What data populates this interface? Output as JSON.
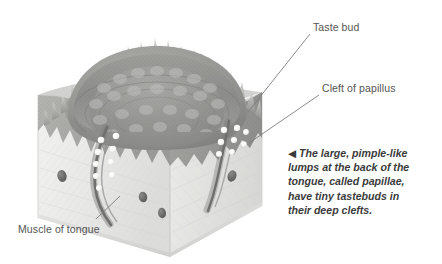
{
  "figure": {
    "background_color": "#ffffff"
  },
  "labels": [
    {
      "id": "taste-bud",
      "text": "Taste bud",
      "x": 313,
      "y": 21
    },
    {
      "id": "cleft",
      "text": "Cleft of papillus",
      "x": 322,
      "y": 82
    },
    {
      "id": "muscle",
      "text": "Muscle of tongue",
      "x": 18,
      "y": 223
    }
  ],
  "caption": {
    "arrow": "◀",
    "lines": [
      "The large, pimple-like",
      "lumps at the back of the",
      "tongue, called papillae,",
      "have tiny tastebuds in",
      "their deep clefts."
    ],
    "full_text": "◀ The large, pimple-like lumps at the back of the tongue, called papillae, have tiny tastebuds in their deep clefts."
  },
  "colors": {
    "label_text": "#555555",
    "caption_text": "#3b3b3b",
    "leader_line": "#7a7a7a",
    "epithelium_dark": "#8d8d8c",
    "epithelium_mid": "#a3a3a1",
    "epithelium_light": "#c2c2bf",
    "muscle_pale": "#ececeb",
    "muscle_shadow": "#dcdcda",
    "tastebud_white": "#fdfdfb",
    "vessel_dark": "#6e6e6c",
    "cleft_dark": "#6f6f6d"
  },
  "anatomy": {
    "parts": [
      "filiform spikes",
      "papilla dome",
      "circular cleft",
      "taste buds",
      "epithelium layer",
      "tongue muscle",
      "blood vessels"
    ],
    "taste_bud_count_left": 9,
    "taste_bud_count_right": 8,
    "vessel_count": 4
  }
}
